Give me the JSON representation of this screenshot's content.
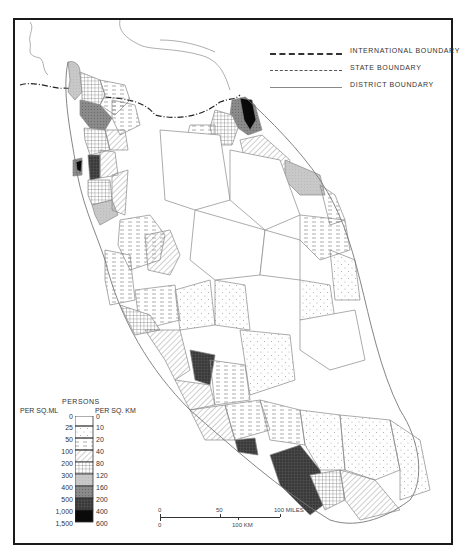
{
  "map": {
    "title": "Population density by district, Malay Peninsula",
    "boundary_legend": [
      {
        "style": "international",
        "label": "INTERNATIONAL  BOUNDARY"
      },
      {
        "style": "state",
        "label": "STATE  BOUNDARY"
      },
      {
        "style": "district",
        "label": "DISTRICT  BOUNDARY"
      }
    ],
    "density_legend": {
      "title": "PERSONS",
      "left_header": "PER SQ.ML",
      "right_header": "PER SQ. KM",
      "per_sq_mile": [
        "0",
        "25",
        "50",
        "100",
        "200",
        "300",
        "400",
        "500",
        "1,000",
        "1,500"
      ],
      "per_sq_km": [
        "0",
        "10",
        "20",
        "40",
        "80",
        "120",
        "160",
        "200",
        "400",
        "600"
      ],
      "classes": [
        {
          "range_mi": "0-25",
          "range_km": "0-10",
          "pattern": "blank"
        },
        {
          "range_mi": "25-50",
          "range_km": "10-20",
          "pattern": "sparse-dots"
        },
        {
          "range_mi": "50-100",
          "range_km": "20-40",
          "pattern": "dashes"
        },
        {
          "range_mi": "100-200",
          "range_km": "40-80",
          "pattern": "diagonal-hatch"
        },
        {
          "range_mi": "200-300",
          "range_km": "80-120",
          "pattern": "grid"
        },
        {
          "range_mi": "300-400",
          "range_km": "120-160",
          "pattern": "light-grey"
        },
        {
          "range_mi": "400-500",
          "range_km": "160-200",
          "pattern": "mid-grey"
        },
        {
          "range_mi": "500-1,000",
          "range_km": "200-400",
          "pattern": "dark-grid"
        },
        {
          "range_mi": "1,000-1,500",
          "range_km": "400-600",
          "pattern": "black"
        }
      ]
    },
    "scale_bar": {
      "miles_labels": [
        "0",
        "50",
        "100 MILES"
      ],
      "km_labels": [
        "0",
        "100 KM"
      ]
    },
    "colors": {
      "frame": "#1a1a1a",
      "boundary": "#888888",
      "light_grey": "#c8c8c8",
      "mid_grey": "#8a8a8a",
      "dark": "#3a3a3a",
      "black": "#0a0a0a"
    }
  }
}
